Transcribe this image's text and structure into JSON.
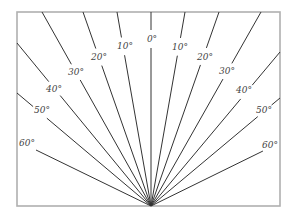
{
  "diagram": {
    "type": "angle-fan",
    "frame": {
      "x": 17,
      "y": 12,
      "width": 263,
      "height": 194,
      "color": "#b0b0b0"
    },
    "apex": {
      "x": 151,
      "y": 206
    },
    "line_color": "#333333",
    "rays": [
      {
        "label": "60°",
        "side": "left",
        "end": [
          36,
          150
        ],
        "label_pos": [
          27,
          143
        ]
      },
      {
        "label": "50°",
        "side": "left",
        "end": [
          17,
          93
        ],
        "label_pos": [
          42,
          110
        ]
      },
      {
        "label": "40°",
        "side": "left",
        "end": [
          17,
          43
        ],
        "label_pos": [
          54,
          89
        ]
      },
      {
        "label": "30°",
        "side": "left",
        "end": [
          42,
          12
        ],
        "label_pos": [
          76,
          72
        ]
      },
      {
        "label": "20°",
        "side": "left",
        "end": [
          83,
          12
        ],
        "label_pos": [
          99,
          57
        ]
      },
      {
        "label": "10°",
        "side": "left",
        "end": [
          117,
          12
        ],
        "label_pos": [
          125,
          46
        ]
      },
      {
        "label": "0°",
        "side": "center",
        "end": [
          151,
          12
        ],
        "label_pos": [
          152,
          39
        ]
      },
      {
        "label": "10°",
        "side": "right",
        "end": [
          185,
          12
        ],
        "label_pos": [
          180,
          47
        ]
      },
      {
        "label": "20°",
        "side": "right",
        "end": [
          219,
          12
        ],
        "label_pos": [
          205,
          57
        ]
      },
      {
        "label": "30°",
        "side": "right",
        "end": [
          261,
          12
        ],
        "label_pos": [
          227,
          71
        ]
      },
      {
        "label": "40°",
        "side": "right",
        "end": [
          280,
          52
        ],
        "label_pos": [
          244,
          90
        ]
      },
      {
        "label": "50°",
        "side": "right",
        "end": [
          280,
          98
        ],
        "label_pos": [
          264,
          110
        ]
      },
      {
        "label": "60°",
        "side": "right",
        "end": [
          265,
          150
        ],
        "label_pos": [
          270,
          145
        ]
      }
    ]
  }
}
